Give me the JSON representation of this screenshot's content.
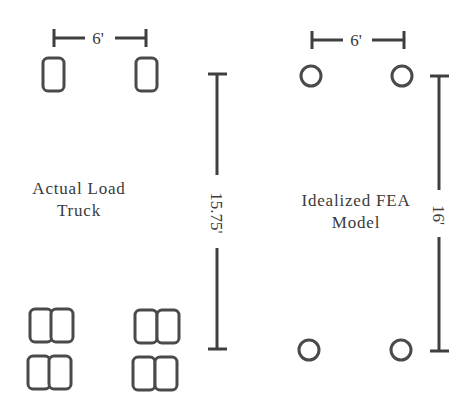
{
  "diagram": {
    "type": "load-truck-idealization",
    "colors": {
      "line": "#4a4a4a",
      "text": "#3a3a3a",
      "background": "#ffffff"
    },
    "left_panel": {
      "label_lines": [
        "Actual Load",
        "Truck"
      ],
      "axle_spacing_label": "6'",
      "wheelbase_label": "15.75'",
      "front_tires": {
        "count": 2,
        "shape": "rounded-rectangle"
      },
      "rear_tires": {
        "count": 8,
        "shape": "dual rounded-rectangle",
        "arrangement": "2 axles × 2 sides × dual"
      }
    },
    "right_panel": {
      "label_lines": [
        "Idealized FEA",
        "Model"
      ],
      "axle_spacing_label": "6'",
      "wheelbase_label": "16'",
      "point_loads": {
        "count": 4,
        "shape": "circle"
      }
    }
  }
}
